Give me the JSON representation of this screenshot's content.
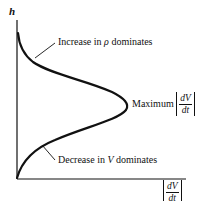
{
  "diagram": {
    "axes": {
      "y_label": "h",
      "x_label": {
        "numerator": "dV",
        "denominator": "dt",
        "absolute_value": true
      }
    },
    "annotations": {
      "upper": {
        "prefix": "Increase in ",
        "symbol": "ρ",
        "suffix": " dominates"
      },
      "peak": {
        "text": "Maximum",
        "numerator": "dV",
        "denominator": "dt",
        "absolute_value": true
      },
      "lower": {
        "prefix": "Decrease in ",
        "symbol": "V",
        "suffix": " dominates"
      }
    },
    "colors": {
      "line": "#111111",
      "background": "#ffffff"
    }
  }
}
